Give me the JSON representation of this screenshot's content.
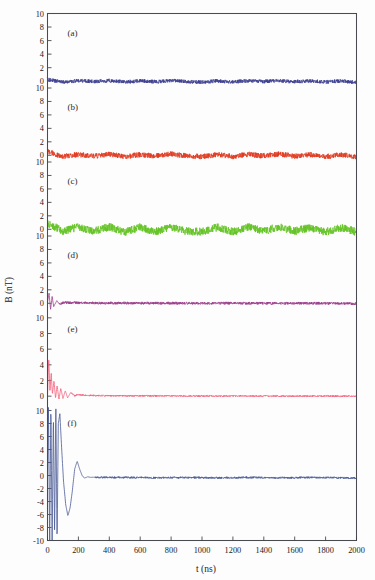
{
  "figure": {
    "background_color": "#fdfdfd",
    "frame_color": "#4a4a52",
    "width": 375,
    "height": 580
  },
  "axes": {
    "x_axis_title": "t (ns)",
    "y_axis_title": "B (nT)",
    "x_ticks": [
      "0",
      "200",
      "400",
      "600",
      "800",
      "1000",
      "1200",
      "1400",
      "1600",
      "1800",
      "2000"
    ],
    "x_min": 0,
    "x_max": 2000
  },
  "chart_data": {
    "type": "line",
    "title": "",
    "subtitle": "",
    "xlabel": "t (ns)",
    "ylabel": "B (nT)",
    "xlim": [
      0,
      2000
    ],
    "grid": false,
    "legend": "none",
    "stacked_panels": true,
    "panel_count": 6,
    "x_tick_values": [
      0,
      200,
      400,
      600,
      800,
      1000,
      1200,
      1400,
      1600,
      1800,
      2000
    ],
    "panels": [
      {
        "label": "(a)",
        "color": "#3c3f8f",
        "ylim": [
          -1,
          10
        ],
        "y_ticks": [
          0,
          2,
          4,
          6,
          8,
          10
        ],
        "y_tick_labels": [
          "0",
          "2",
          "4",
          "6",
          "8",
          "10"
        ],
        "baseline": 0.0,
        "description": "flat low-amplitude noise about zero",
        "noise_amplitude": 0.28,
        "transient_peak": 0.5,
        "transient_decay_ns": 20,
        "oscillation_period_ns": 0,
        "series": [
          {
            "name": "B_a",
            "x": [
              0,
              50,
              100,
              200,
              300,
              400,
              500,
              600,
              700,
              800,
              900,
              1000,
              1100,
              1200,
              1300,
              1400,
              1500,
              1600,
              1700,
              1800,
              1900,
              2000
            ],
            "values": [
              0.3,
              0.05,
              -0.1,
              0.08,
              -0.05,
              0.1,
              -0.12,
              0.06,
              -0.08,
              0.12,
              -0.06,
              -0.15,
              0.05,
              -0.1,
              0.08,
              -0.05,
              0.1,
              -0.08,
              0.06,
              -0.12,
              0.04,
              -0.2
            ]
          }
        ]
      },
      {
        "label": "(b)",
        "color": "#e03a20",
        "ylim": [
          -1,
          10
        ],
        "y_ticks": [
          0,
          2,
          4,
          6,
          8,
          10
        ],
        "y_tick_labels": [
          "0",
          "2",
          "4",
          "6",
          "8",
          "10"
        ],
        "baseline": 0.0,
        "description": "flat low-amplitude noise about zero, red",
        "noise_amplitude": 0.4,
        "transient_peak": 0.8,
        "transient_decay_ns": 25,
        "oscillation_period_ns": 0,
        "series": [
          {
            "name": "B_b",
            "x": [
              0,
              50,
              100,
              200,
              300,
              400,
              500,
              600,
              700,
              800,
              900,
              1000,
              1100,
              1200,
              1300,
              1400,
              1500,
              1600,
              1700,
              1800,
              1900,
              2000
            ],
            "values": [
              0.6,
              0.15,
              -0.18,
              0.12,
              -0.15,
              0.2,
              -0.22,
              0.1,
              -0.12,
              0.2,
              -0.1,
              -0.2,
              0.12,
              -0.18,
              0.15,
              -0.1,
              0.18,
              -0.14,
              0.1,
              -0.2,
              0.08,
              -0.25
            ]
          }
        ]
      },
      {
        "label": "(c)",
        "color": "#63c324",
        "ylim": [
          -1,
          10
        ],
        "y_ticks": [
          0,
          2,
          4,
          6,
          8,
          10
        ],
        "y_tick_labels": [
          "0",
          "2",
          "4",
          "6",
          "8",
          "10"
        ],
        "baseline": 0.0,
        "description": "dense green noise band about zero",
        "noise_amplitude": 0.6,
        "transient_peak": 1.0,
        "transient_decay_ns": 30,
        "oscillation_period_ns": 0,
        "series": [
          {
            "name": "B_c",
            "x": [
              0,
              50,
              100,
              200,
              300,
              400,
              500,
              600,
              700,
              800,
              900,
              1000,
              1100,
              1200,
              1300,
              1400,
              1500,
              1600,
              1700,
              1800,
              1900,
              2000
            ],
            "values": [
              0.8,
              0.3,
              -0.3,
              0.35,
              -0.3,
              0.4,
              -0.4,
              0.3,
              -0.35,
              0.4,
              -0.3,
              -0.35,
              0.3,
              -0.4,
              0.35,
              -0.3,
              0.4,
              -0.3,
              0.3,
              -0.4,
              0.25,
              -0.4
            ]
          }
        ]
      },
      {
        "label": "(d)",
        "color": "#9b3c8c",
        "ylim": [
          -1,
          10
        ],
        "y_ticks": [
          0,
          2,
          4,
          6,
          8,
          10
        ],
        "y_tick_labels": [
          "0",
          "2",
          "4",
          "6",
          "8",
          "10"
        ],
        "baseline": 0.0,
        "description": "small damped spike at t=0 then flat purple line",
        "noise_amplitude": 0.2,
        "transient_peak": 1.6,
        "transient_decay_ns": 35,
        "oscillation_period_ns": 22,
        "series": [
          {
            "name": "B_d",
            "x": [
              0,
              10,
              20,
              30,
              40,
              60,
              80,
              100,
              200,
              400,
              600,
              800,
              1000,
              1200,
              1400,
              1600,
              1800,
              2000
            ],
            "values": [
              0.2,
              1.5,
              -0.9,
              1.0,
              -0.5,
              0.4,
              -0.2,
              0.12,
              0.05,
              0.03,
              0.02,
              0.02,
              0.01,
              0.01,
              0.0,
              0.0,
              0.0,
              -0.05
            ]
          }
        ]
      },
      {
        "label": "(e)",
        "color": "#f2607a",
        "ylim": [
          -1,
          11
        ],
        "y_ticks": [
          0,
          2,
          4,
          6,
          8,
          10
        ],
        "y_tick_labels": [
          "0",
          "2",
          "4",
          "6",
          "8",
          "10"
        ],
        "baseline": 0.0,
        "description": "damped oscillation peaking near 5 nT decaying by 200 ns, pink-red",
        "noise_amplitude": 0.1,
        "transient_peak": 5.0,
        "transient_decay_ns": 70,
        "oscillation_period_ns": 40,
        "series": [
          {
            "name": "B_e",
            "x": [
              0,
              8,
              16,
              24,
              32,
              42,
              52,
              62,
              74,
              86,
              100,
              115,
              130,
              150,
              175,
              200,
              250,
              400,
              800,
              1200,
              1600,
              2000
            ],
            "values": [
              0.0,
              4.9,
              0.6,
              3.0,
              0.2,
              2.0,
              -0.3,
              1.4,
              -0.4,
              1.0,
              -0.3,
              0.7,
              -0.2,
              0.45,
              0.05,
              0.2,
              0.1,
              0.05,
              0.03,
              0.02,
              0.01,
              0.0
            ]
          }
        ]
      },
      {
        "label": "(f)",
        "color": "#4a5a96",
        "ylim": [
          -10,
          11
        ],
        "y_ticks": [
          -10,
          -8,
          -6,
          -4,
          -2,
          0,
          2,
          4,
          6,
          8,
          10
        ],
        "y_tick_labels": [
          "-10",
          "-8",
          "-6",
          "-4",
          "-2",
          "0",
          "2",
          "4",
          "6",
          "8",
          "10"
        ],
        "baseline": 0.0,
        "description": "large damped oscillation, excursions beyond +/-10 nT near t=0, ringing decays by 300 ns, blue",
        "noise_amplitude": 0.15,
        "transient_peak": 11.0,
        "transient_decay_ns": 140,
        "oscillation_period_ns": 85,
        "series": [
          {
            "name": "B_f",
            "x": [
              0,
              6,
              14,
              22,
              30,
              38,
              46,
              54,
              62,
              70,
              80,
              92,
              104,
              118,
              132,
              146,
              160,
              176,
              192,
              208,
              224,
              240,
              260,
              280,
              300,
              340,
              400,
              500,
              700,
              900,
              1100,
              1300,
              1500,
              1700,
              1900,
              2000
            ],
            "values": [
              0.0,
              11.0,
              -11.0,
              11.0,
              -11.0,
              9.5,
              -9.0,
              11.0,
              -10.5,
              8.0,
              9.5,
              4.0,
              -1.0,
              -4.5,
              -6.2,
              -5.0,
              -2.5,
              1.0,
              2.2,
              1.0,
              0.0,
              -0.4,
              -0.2,
              -0.3,
              -0.25,
              -0.3,
              -0.3,
              -0.3,
              -0.35,
              -0.3,
              -0.35,
              -0.3,
              -0.35,
              -0.3,
              -0.35,
              -0.4
            ]
          }
        ]
      }
    ]
  }
}
